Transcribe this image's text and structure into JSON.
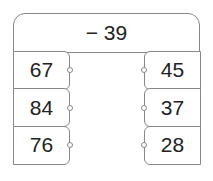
{
  "header": {
    "operation": "− 39"
  },
  "left_column": {
    "values": [
      "67",
      "84",
      "76"
    ]
  },
  "right_column": {
    "values": [
      "45",
      "37",
      "28"
    ]
  }
}
